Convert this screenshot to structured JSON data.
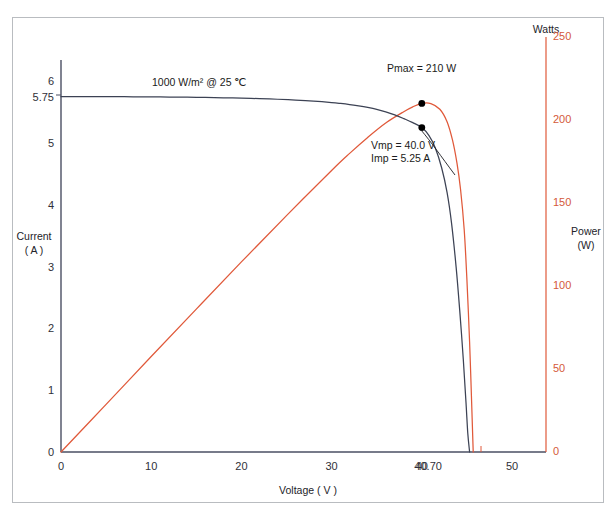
{
  "chart_data": {
    "type": "line",
    "title": "",
    "subtitle": "",
    "xlabel": "Voltage ( V )",
    "ylabel": "Current\n( A )",
    "y2label": "Power\n(W)",
    "y2header": "Watts",
    "xlim": [
      0,
      52.5
    ],
    "ylim": [
      0,
      6.25
    ],
    "y2lim": [
      0,
      260
    ],
    "grid": false,
    "legend_position": "none",
    "xticks": [
      {
        "value": 0,
        "label": "0"
      },
      {
        "value": 10,
        "label": "10"
      },
      {
        "value": 20,
        "label": "20"
      },
      {
        "value": 30,
        "label": "30"
      },
      {
        "value": 40,
        "label": "40"
      },
      {
        "value": 40.7,
        "label": "40.70"
      },
      {
        "value": 50,
        "label": "50"
      }
    ],
    "yticks": [
      {
        "value": 0,
        "label": "0"
      },
      {
        "value": 1,
        "label": "1"
      },
      {
        "value": 2,
        "label": "2"
      },
      {
        "value": 3,
        "label": "3"
      },
      {
        "value": 4,
        "label": "4"
      },
      {
        "value": 5,
        "label": "5"
      },
      {
        "value": 5.75,
        "label": "5.75"
      },
      {
        "value": 6,
        "label": "6"
      }
    ],
    "y2ticks": [
      {
        "value": 0,
        "label": "0"
      },
      {
        "value": 50,
        "label": "50"
      },
      {
        "value": 100,
        "label": "100"
      },
      {
        "value": 150,
        "label": "150"
      },
      {
        "value": 200,
        "label": "200"
      },
      {
        "value": 250,
        "label": "250"
      }
    ],
    "series": [
      {
        "name": "Current (I-V curve)",
        "axis": "left",
        "color": "#3c4254",
        "points": [
          [
            0,
            5.75
          ],
          [
            2,
            5.75
          ],
          [
            4,
            5.75
          ],
          [
            6,
            5.749
          ],
          [
            8,
            5.748
          ],
          [
            10,
            5.746
          ],
          [
            12,
            5.744
          ],
          [
            14,
            5.741
          ],
          [
            16,
            5.737
          ],
          [
            18,
            5.732
          ],
          [
            20,
            5.726
          ],
          [
            22,
            5.718
          ],
          [
            24,
            5.708
          ],
          [
            26,
            5.695
          ],
          [
            28,
            5.678
          ],
          [
            30,
            5.655
          ],
          [
            31,
            5.64
          ],
          [
            32,
            5.622
          ],
          [
            33,
            5.6
          ],
          [
            34,
            5.575
          ],
          [
            35,
            5.545
          ],
          [
            36,
            5.505
          ],
          [
            37,
            5.455
          ],
          [
            38,
            5.395
          ],
          [
            39,
            5.33
          ],
          [
            40,
            5.25
          ],
          [
            40.8,
            5.12
          ],
          [
            41.5,
            4.92
          ],
          [
            42.2,
            4.6
          ],
          [
            42.8,
            4.2
          ],
          [
            43.3,
            3.7
          ],
          [
            43.8,
            3.0
          ],
          [
            44.2,
            2.3
          ],
          [
            44.6,
            1.5
          ],
          [
            44.9,
            0.8
          ],
          [
            45.1,
            0.3
          ],
          [
            45.3,
            0
          ]
        ]
      },
      {
        "name": "Power (P-V curve)",
        "axis": "right",
        "color": "#e0593a",
        "points": [
          [
            0,
            0
          ],
          [
            5,
            28.7
          ],
          [
            10,
            57.5
          ],
          [
            15,
            86.1
          ],
          [
            20,
            114.5
          ],
          [
            25,
            142.4
          ],
          [
            30,
            169.6
          ],
          [
            32,
            179.9
          ],
          [
            34,
            189.5
          ],
          [
            36,
            198.2
          ],
          [
            38,
            205.0
          ],
          [
            39,
            207.9
          ],
          [
            40,
            210.0
          ],
          [
            41,
            209.9
          ],
          [
            42,
            206.5
          ],
          [
            42.8,
            199.0
          ],
          [
            43.4,
            188.0
          ],
          [
            43.9,
            174.0
          ],
          [
            44.3,
            158.0
          ],
          [
            44.7,
            134.0
          ],
          [
            45.0,
            104.0
          ],
          [
            45.3,
            66.0
          ],
          [
            45.5,
            34.0
          ],
          [
            45.7,
            0
          ]
        ]
      }
    ],
    "markers": [
      {
        "name": "pmax-marker",
        "x": 40,
        "y": 210,
        "axis": "right"
      },
      {
        "name": "mpp-marker",
        "x": 40,
        "y": 5.25,
        "axis": "left"
      }
    ],
    "annotations": [
      {
        "name": "irradiance-annotation",
        "text": "1000 W/m² @ 25 ℃",
        "x": 152,
        "y": 77
      },
      {
        "name": "pmax-annotation",
        "text": "Pmax = 210 W",
        "x": 387,
        "y": 63
      },
      {
        "name": "vmp-annotation",
        "text": "Vmp = 40.0 V",
        "x": 371,
        "y": 140
      },
      {
        "name": "imp-annotation",
        "text": "Imp = 5.25 A",
        "x": 371,
        "y": 153
      }
    ],
    "colors": {
      "current_curve": "#3c4254",
      "power_curve": "#e0593a",
      "left_axis": "#4a4f63",
      "right_axis": "#e0593a",
      "x_axis": "#4a4f63",
      "frame": "#b9bcc0",
      "tick_text": "#2f3038",
      "right_tick_text": "#d4593a",
      "background": "#ffffff"
    }
  },
  "axes": {
    "left_title_line1": "Current",
    "left_title_line2": "( A )",
    "bottom_title": "Voltage ( V )",
    "right_header": "Watts",
    "right_title_line1": "Power",
    "right_title_line2": "(W)"
  }
}
